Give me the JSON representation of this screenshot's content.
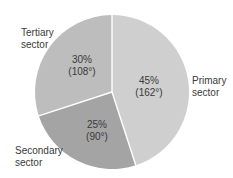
{
  "chart_data": {
    "type": "pie",
    "title": "",
    "start_angle_deg": 0,
    "direction": "clockwise",
    "slices": [
      {
        "name": "Primary sector",
        "label_lines": [
          "Primary",
          "sector"
        ],
        "percent": 45,
        "degrees": 162,
        "value_label": "45%",
        "degree_label": "(162°)",
        "color": "#cfcfcf"
      },
      {
        "name": "Secondary sector",
        "label_lines": [
          "Secondary",
          "sector"
        ],
        "percent": 25,
        "degrees": 90,
        "value_label": "25%",
        "degree_label": "(90°)",
        "color": "#a4a4a4"
      },
      {
        "name": "Tertiary sector",
        "label_lines": [
          "Tertiary",
          "sector"
        ],
        "percent": 30,
        "degrees": 108,
        "value_label": "30%",
        "degree_label": "(108°)",
        "color": "#bdbdbd"
      }
    ],
    "categories": [
      "Primary sector",
      "Secondary sector",
      "Tertiary sector"
    ],
    "values": [
      45,
      25,
      30
    ],
    "legend": "none (direct labels)"
  },
  "colors": {
    "divider": "#ffffff",
    "text": "#3a3a3a"
  }
}
